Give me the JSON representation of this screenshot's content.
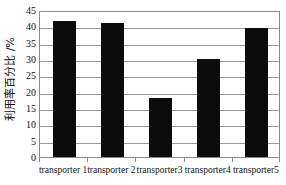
{
  "chart_data": {
    "type": "bar",
    "title": "",
    "xlabel": "",
    "ylabel": "利用率百分比 /%",
    "categories": [
      "transporter 1",
      "transporter 2",
      "transporter3",
      "transporter4",
      "transporter5"
    ],
    "values": [
      41.5,
      41.0,
      18.2,
      30.0,
      39.5
    ],
    "series": [
      {
        "name": "利用率百分比",
        "values": [
          41.5,
          41.0,
          18.2,
          30.0,
          39.5
        ]
      }
    ],
    "ylim": [
      0,
      45
    ],
    "ytick_labels": [
      "0",
      "5",
      "10",
      "15",
      "20",
      "25",
      "30",
      "35",
      "40",
      "45"
    ],
    "ytick_values": [
      0,
      5,
      10,
      15,
      20,
      25,
      30,
      35,
      40,
      45
    ],
    "grid": true,
    "legend": false,
    "legend_position": "none",
    "bar_color": "#0c0c0c",
    "grid_color": "#9a9a9a",
    "frame_color": "#8a8a8a",
    "background_color": "#ffffff",
    "text_color": "#111111"
  }
}
